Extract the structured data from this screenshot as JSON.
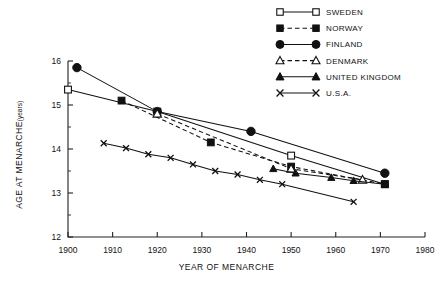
{
  "chart_data": {
    "type": "line",
    "title": "",
    "xlabel": "YEAR OF MENARCHE",
    "ylabel": "AGE AT MENARCHE",
    "ylabel_units": "(years)",
    "xlim": [
      1900,
      1980
    ],
    "ylim": [
      12,
      16
    ],
    "xticks": [
      1900,
      1910,
      1920,
      1930,
      1940,
      1950,
      1960,
      1970,
      1980
    ],
    "yticks": [
      12,
      13,
      14,
      15,
      16
    ],
    "grid": false,
    "legend_position": "top-right",
    "series": [
      {
        "name": "SWEDEN",
        "marker": "open-square",
        "line": "solid",
        "x": [
          1900,
          1920,
          1950,
          1971
        ],
        "y": [
          15.35,
          14.85,
          13.85,
          13.2
        ]
      },
      {
        "name": "NORWAY",
        "marker": "filled-square",
        "line": "dashed",
        "x": [
          1912,
          1932,
          1950,
          1971
        ],
        "y": [
          15.1,
          14.15,
          13.6,
          13.2
        ]
      },
      {
        "name": "FINLAND",
        "marker": "filled-circle",
        "line": "solid",
        "x": [
          1902,
          1920,
          1941,
          1971
        ],
        "y": [
          15.85,
          14.85,
          14.4,
          13.45
        ]
      },
      {
        "name": "DENMARK",
        "marker": "open-triangle",
        "line": "dashed",
        "x": [
          1920,
          1950,
          1966
        ],
        "y": [
          14.8,
          13.55,
          13.3
        ]
      },
      {
        "name": "UNITED KINGDOM",
        "marker": "filled-triangle",
        "line": "solid",
        "x": [
          1946,
          1951,
          1959,
          1964,
          1971
        ],
        "y": [
          13.55,
          13.45,
          13.35,
          13.28,
          13.2
        ]
      },
      {
        "name": "U.S.A.",
        "marker": "cross",
        "line": "solid",
        "x": [
          1908,
          1913,
          1918,
          1923,
          1928,
          1933,
          1938,
          1943,
          1948,
          1964
        ],
        "y": [
          14.13,
          14.02,
          13.88,
          13.8,
          13.65,
          13.5,
          13.42,
          13.3,
          13.2,
          12.8
        ]
      }
    ],
    "legend": [
      {
        "label": "SWEDEN",
        "marker": "open-square",
        "line": "solid"
      },
      {
        "label": "NORWAY",
        "marker": "filled-square",
        "line": "dashed"
      },
      {
        "label": "FINLAND",
        "marker": "filled-circle",
        "line": "solid"
      },
      {
        "label": "DENMARK",
        "marker": "open-triangle",
        "line": "dashed"
      },
      {
        "label": "UNITED KINGDOM",
        "marker": "filled-triangle",
        "line": "solid"
      },
      {
        "label": "U.S.A.",
        "marker": "cross",
        "line": "solid"
      }
    ]
  }
}
